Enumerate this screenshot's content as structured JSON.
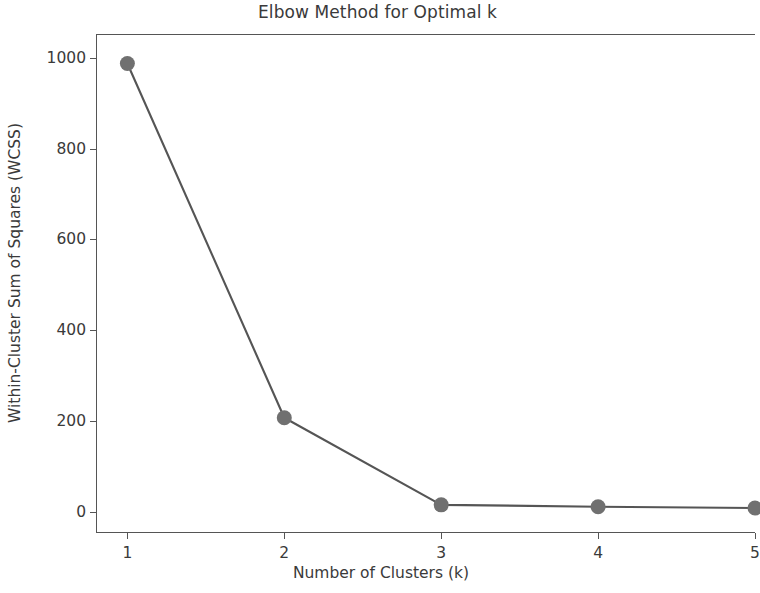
{
  "chart_data": {
    "type": "line",
    "title": "Elbow Method for Optimal k",
    "xlabel": "Number of Clusters (k)",
    "ylabel": "Within-Cluster Sum of Squares (WCSS)",
    "x": [
      1,
      2,
      3,
      4,
      5
    ],
    "values": [
      988,
      207,
      15,
      11,
      8
    ],
    "series": [
      {
        "name": "WCSS",
        "values": [
          988,
          207,
          15,
          11,
          8
        ]
      }
    ],
    "xlim": [
      0.8,
      5.0
    ],
    "ylim": [
      -47,
      1053
    ],
    "xticks": [
      1,
      2,
      3,
      4,
      5
    ],
    "xticklabels": [
      "1",
      "2",
      "3",
      "4",
      "5"
    ],
    "yticks": [
      0,
      200,
      400,
      600,
      800,
      1000
    ],
    "yticklabels": [
      "0",
      "200",
      "400",
      "600",
      "800",
      "1000"
    ],
    "grid": false,
    "legend": false,
    "legend_position": "none",
    "marker": "circle",
    "line_color": "#555555",
    "marker_color": "#707070",
    "background_color": "#ffffff",
    "axis_color": "#555555",
    "text_color": "#3a3a3a"
  }
}
